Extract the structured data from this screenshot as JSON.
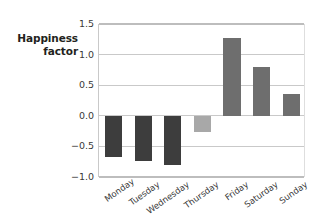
{
  "chart_data": {
    "type": "bar",
    "title": "",
    "xlabel": "",
    "ylabel": "Happiness factor",
    "ylabel_lines": [
      "Happiness",
      "factor"
    ],
    "categories": [
      "Monday",
      "Tuesday",
      "Wednesday",
      "Thursday",
      "Friday",
      "Saturday",
      "Sunday"
    ],
    "values": [
      -0.67,
      -0.74,
      -0.81,
      -0.27,
      1.27,
      0.79,
      0.36
    ],
    "bar_colors": [
      "#3d3d3d",
      "#3d3d3d",
      "#3d3d3d",
      "#a8a8a8",
      "#6e6e6e",
      "#6e6e6e",
      "#6e6e6e"
    ],
    "ylim": [
      -1.0,
      1.5
    ],
    "yticks": [
      1.5,
      1.0,
      0.5,
      0.0,
      -0.5,
      -1.0
    ],
    "ytick_labels": [
      "1.5",
      "1.0",
      "0.5",
      "0.0",
      "−0.5",
      "−1.0"
    ],
    "grid": true,
    "grid_color": "#c9c9c9",
    "legend": "none",
    "xtick_rotation": -35,
    "background": "#ffffff",
    "series": [
      {
        "name": "Happiness factor",
        "values": [
          -0.67,
          -0.74,
          -0.81,
          -0.27,
          1.27,
          0.79,
          0.36
        ]
      }
    ]
  }
}
